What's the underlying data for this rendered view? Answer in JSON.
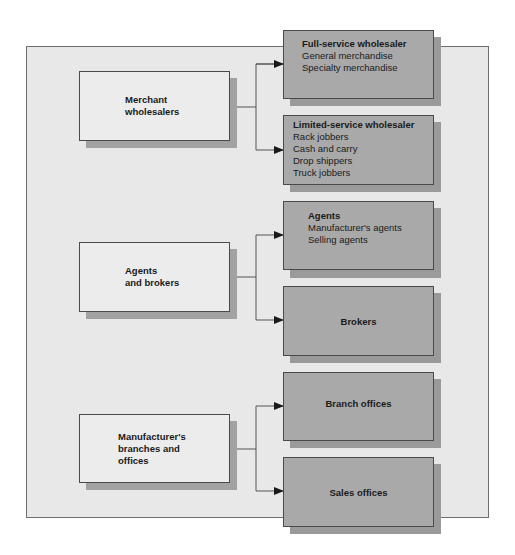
{
  "diagram": {
    "groups": [
      {
        "source": {
          "lines": [
            "Merchant",
            "wholesalers"
          ]
        },
        "targets": [
          {
            "title": "Full-service wholesaler",
            "items": [
              "General merchandise",
              "Specialty merchandise"
            ]
          },
          {
            "title": "Limited-service wholesaler",
            "items": [
              "Rack jobbers",
              "Cash and carry",
              "Drop shippers",
              "Truck jobbers"
            ]
          }
        ]
      },
      {
        "source": {
          "lines": [
            "Agents",
            "and brokers"
          ]
        },
        "targets": [
          {
            "title": "Agents",
            "items": [
              "Manufacturer's agents",
              "Selling agents"
            ]
          },
          {
            "title": "Brokers",
            "items": []
          }
        ]
      },
      {
        "source": {
          "lines": [
            "Manufacturer's",
            "branches and",
            "offices"
          ]
        },
        "targets": [
          {
            "title": "Branch offices",
            "items": []
          },
          {
            "title": "Sales offices",
            "items": []
          }
        ]
      }
    ],
    "colors": {
      "frame_fill": "#e8e8e8",
      "source_fill": "#ececec",
      "target_fill": "#a9a9a9",
      "shadow": "#a2a2a2",
      "line": "#4a4a4a"
    }
  }
}
